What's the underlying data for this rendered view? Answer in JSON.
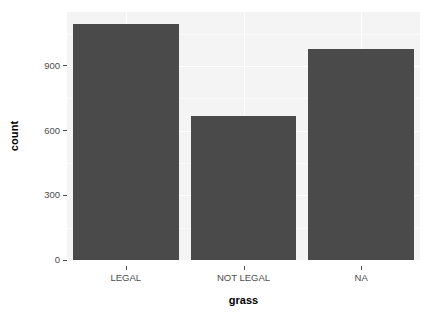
{
  "chart_data": {
    "type": "bar",
    "title": "",
    "subtitle": "",
    "xlabel": "grass",
    "ylabel": "count",
    "categories": [
      "LEGAL",
      "NOT LEGAL",
      "NA"
    ],
    "values": [
      1096,
      670,
      978
    ],
    "ylim": [
      0,
      1150
    ],
    "y_ticks": [
      0,
      300,
      600,
      900
    ],
    "y_tick_labels": [
      "0",
      "300",
      "600",
      "900"
    ],
    "grid": true,
    "grid_minor_y": [
      150,
      450,
      750,
      1050
    ],
    "legend": "none",
    "bar_color": "#4a4a4a",
    "panel_color": "#f4f4f4",
    "gridline_color": "#ffffff",
    "axis_text_color": "#4d4d4d",
    "annotations": []
  },
  "axes": {
    "y_title": "count",
    "x_title": "grass"
  }
}
